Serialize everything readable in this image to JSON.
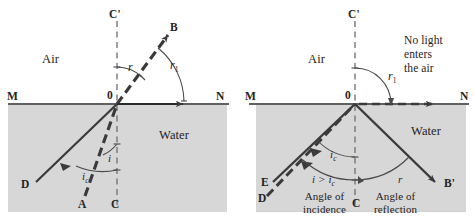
{
  "figure": {
    "type": "physics-optics-diagram",
    "colors": {
      "water_fill": "#d7d7d7",
      "ray_stroke": "#3a3a3a",
      "surface_line": "#2b2b2b",
      "normal_dash": "#6e6e6e",
      "arc": "#4a4a4a",
      "text": "#232323"
    }
  },
  "panels": [
    {
      "id": "left",
      "media": {
        "upper": "Air",
        "lower": "Water"
      },
      "points": {
        "normal_top": "C'",
        "normal_bottom": "C",
        "origin": "0",
        "surface_left": "M",
        "surface_right": "N",
        "incident_source": "A",
        "critical_source": "D",
        "refracted_tip": "B"
      },
      "angles": {
        "refraction": "r",
        "grazing_refraction_base": "r",
        "grazing_refraction_sub": "1",
        "incidence": "i",
        "critical_base": "i",
        "critical_sub": "c"
      }
    },
    {
      "id": "right",
      "media": {
        "upper": "Air",
        "lower": "Water"
      },
      "points": {
        "normal_top": "C'",
        "normal_bottom": "C",
        "origin": "0",
        "surface_left": "M",
        "surface_right": "N",
        "incident_source_solid": "E",
        "incident_source_dashed": "D",
        "reflected_tip": "B'"
      },
      "angles": {
        "grazing_base": "r",
        "grazing_sub": "1",
        "critical_base": "i",
        "critical_sub": "c",
        "reflection": "r"
      },
      "notes": {
        "no_light": [
          "No light",
          "enters",
          "the air"
        ],
        "incidence_condition_base": "i > i",
        "incidence_condition_sub": "c",
        "incidence_caption": [
          "Angle of",
          "incidence"
        ],
        "reflection_caption": [
          "Angle of",
          "reflection"
        ]
      }
    }
  ]
}
